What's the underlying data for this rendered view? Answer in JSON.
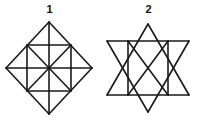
{
  "page": {
    "background_color": "#ffffff",
    "stroke_color": "#1a1a1a",
    "width": 198,
    "height": 121
  },
  "figures": [
    {
      "label": "1",
      "name": "diamond-figure",
      "description": "Square rotated 45 degrees (diamond) containing an inscribed upright square, with the inner square's two diagonals and its horizontal and vertical midlines drawn, plus the four corner triangles of the diamond.",
      "shape_type": "diamond-with-inscribed-square",
      "viewbox": "0 0 99 105",
      "vertices": {
        "diamond_top": [
          49,
          6
        ],
        "diamond_right": [
          92,
          52
        ],
        "diamond_bottom": [
          49,
          98
        ],
        "diamond_left": [
          6,
          52
        ],
        "inner_top_left": [
          27,
          29
        ],
        "inner_top_right": [
          71,
          29
        ],
        "inner_bottom_right": [
          71,
          75
        ],
        "inner_bottom_left": [
          27,
          75
        ],
        "center": [
          49,
          52
        ]
      },
      "segments": [
        [
          49,
          6,
          92,
          52
        ],
        [
          92,
          52,
          49,
          98
        ],
        [
          49,
          98,
          6,
          52
        ],
        [
          6,
          52,
          49,
          6
        ],
        [
          27,
          29,
          71,
          29
        ],
        [
          71,
          29,
          71,
          75
        ],
        [
          71,
          75,
          27,
          75
        ],
        [
          27,
          75,
          27,
          29
        ],
        [
          27,
          29,
          71,
          75
        ],
        [
          71,
          29,
          27,
          75
        ],
        [
          49,
          29,
          49,
          75
        ],
        [
          27,
          52,
          71,
          52
        ],
        [
          49,
          6,
          49,
          29
        ],
        [
          49,
          75,
          49,
          98
        ],
        [
          6,
          52,
          27,
          52
        ],
        [
          71,
          52,
          92,
          52
        ]
      ]
    },
    {
      "label": "2",
      "name": "hexagram-figure",
      "description": "Six-pointed star (Star of David) formed by two overlapping equilateral triangles, with two internal vertical lines joining opposite hexagon vertices and an X crossing through the central hexagon.",
      "shape_type": "hexagram-star-of-david",
      "viewbox": "0 0 99 105",
      "vertices": {
        "triangle_up_apex": [
          49,
          8
        ],
        "triangle_up_left": [
          8,
          79
        ],
        "triangle_up_right": [
          90,
          79
        ],
        "triangle_down_apex": [
          49,
          96
        ],
        "triangle_down_left": [
          8,
          25
        ],
        "triangle_down_right": [
          90,
          25
        ],
        "hex_top_left": [
          29,
          25
        ],
        "hex_top_right": [
          69,
          25
        ],
        "hex_right": [
          90,
          52
        ],
        "hex_bottom_right": [
          69,
          79
        ],
        "hex_bottom_left": [
          29,
          79
        ],
        "hex_left": [
          8,
          52
        ]
      },
      "segments": [
        [
          49,
          8,
          90,
          79
        ],
        [
          90,
          79,
          8,
          79
        ],
        [
          8,
          79,
          49,
          8
        ],
        [
          49,
          96,
          8,
          25
        ],
        [
          8,
          25,
          90,
          25
        ],
        [
          90,
          25,
          49,
          96
        ],
        [
          29,
          25,
          29,
          79
        ],
        [
          69,
          25,
          69,
          79
        ],
        [
          29,
          25,
          69,
          79
        ],
        [
          69,
          25,
          29,
          79
        ]
      ]
    }
  ]
}
